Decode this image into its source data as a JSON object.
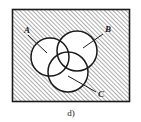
{
  "figure": {
    "caption": "d)",
    "frame": {
      "x": 12,
      "y": 9,
      "width": 118,
      "height": 93,
      "border_color": "#1a1a1a",
      "fill_description": "diagonal-hatch",
      "hatch_color": "#8a8a8a",
      "background_color": "#ffffff"
    },
    "set_labels": [
      {
        "id": "A",
        "text": "A",
        "x": 24,
        "y": 33
      },
      {
        "id": "B",
        "text": "B",
        "x": 105,
        "y": 32
      },
      {
        "id": "C",
        "text": "C",
        "x": 98,
        "y": 97
      }
    ],
    "circles": [
      {
        "id": "A",
        "cx": 50,
        "cy": 57,
        "r": 19,
        "stroke": "#1a1a1a",
        "fill": "#ffffff"
      },
      {
        "id": "B",
        "cx": 77,
        "cy": 51,
        "r": 20,
        "stroke": "#1a1a1a",
        "fill": "#ffffff"
      },
      {
        "id": "C",
        "cx": 68,
        "cy": 72,
        "r": 20,
        "stroke": "#1a1a1a",
        "fill": "#ffffff"
      }
    ],
    "leader_lines": [
      {
        "id": "A",
        "x1": 28,
        "y1": 35,
        "x2": 47,
        "y2": 53
      },
      {
        "id": "B",
        "x1": 103,
        "y1": 34,
        "x2": 83,
        "y2": 48
      },
      {
        "id": "C",
        "x1": 68,
        "y1": 76,
        "x2": 96,
        "y2": 92
      }
    ]
  }
}
